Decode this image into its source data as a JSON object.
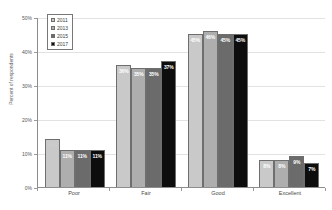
{
  "chart_data": {
    "type": "bar",
    "title": "",
    "xlabel": "",
    "ylabel": "Percent of respondents",
    "ylim": [
      0,
      50
    ],
    "yticks": [
      "0%",
      "10%",
      "20%",
      "30%",
      "40%",
      "50%"
    ],
    "grid": true,
    "legend_position": "top-left-inside",
    "categories": [
      "Poor",
      "Fair",
      "Good",
      "Excellent"
    ],
    "series": [
      {
        "name": "2011",
        "color": "#c9c9c9",
        "values": [
          14,
          36,
          45,
          8
        ],
        "labels": [
          "14%",
          "36%",
          "45%",
          "8%"
        ]
      },
      {
        "name": "2013",
        "color": "#aeaeae",
        "values": [
          11,
          35,
          46,
          8
        ],
        "labels": [
          "11%",
          "35%",
          "46%",
          "8%"
        ]
      },
      {
        "name": "2015",
        "color": "#6b6b6b",
        "values": [
          11,
          35,
          45,
          9
        ],
        "labels": [
          "11%",
          "35%",
          "45%",
          "9%"
        ]
      },
      {
        "name": "2017",
        "color": "#0d0d0d",
        "values": [
          11,
          37,
          45,
          7
        ],
        "labels": [
          "11%",
          "37%",
          "45%",
          "7%"
        ]
      }
    ]
  },
  "axis": {
    "y_title": "Percent of respondents",
    "y_ticks": [
      "50%",
      "40%",
      "30%",
      "20%",
      "10%",
      "0%"
    ]
  },
  "legend": {
    "items": [
      {
        "label": "2011"
      },
      {
        "label": "2013"
      },
      {
        "label": "2015"
      },
      {
        "label": "2017"
      }
    ]
  }
}
